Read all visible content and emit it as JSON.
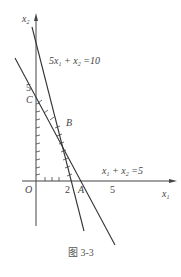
{
  "figure": {
    "caption": "图 3-3",
    "axes": {
      "x_label": "x",
      "x_sub": "1",
      "y_label": "x",
      "y_sub": "2",
      "origin_label": "O"
    },
    "ticks": {
      "x_tick_2": "2",
      "x_tick_5": "5",
      "y_tick_5": "5"
    },
    "points": {
      "A": "A",
      "B": "B",
      "C": "C"
    },
    "lines": [
      {
        "id": "line1",
        "pre": "5x",
        "s1": "1",
        "mid": " + x",
        "s2": "2",
        "post": " =10"
      },
      {
        "id": "line2",
        "pre": "x",
        "s1": "1",
        "mid": " + x",
        "s2": "2",
        "post": " =5"
      }
    ],
    "feasible_region": "OABC (hatched)",
    "stroke_color": "#333333"
  }
}
